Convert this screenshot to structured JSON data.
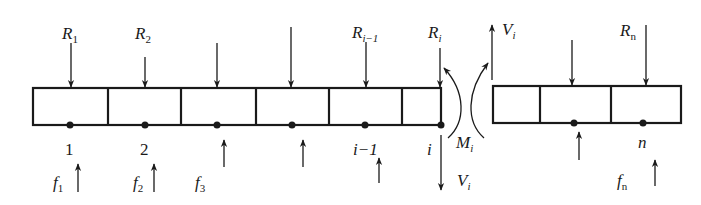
{
  "diagram": {
    "type": "beam-segment-free-body",
    "stroke_color": "#1a1a1a",
    "background": "#ffffff",
    "left_beam": {
      "x": 33,
      "y": 88,
      "width": 408,
      "height": 37,
      "dividers": [
        108,
        181,
        256,
        329,
        402
      ]
    },
    "right_beam": {
      "x": 493,
      "y": 86,
      "width": 188,
      "height": 37,
      "dividers": [
        540,
        611
      ]
    },
    "node_labels": [
      {
        "text": "1",
        "x": 70
      },
      {
        "text": "2",
        "x": 145
      },
      {
        "text": "i−1",
        "x": 365
      },
      {
        "text": "i",
        "x": 431
      },
      {
        "text": "n",
        "x": 643
      }
    ],
    "load_labels": {
      "R1": {
        "base": "R",
        "sub": "1"
      },
      "R2": {
        "base": "R",
        "sub": "2"
      },
      "Ri_1": {
        "base": "R",
        "sub": "i−1"
      },
      "Ri": {
        "base": "R",
        "sub": "i"
      },
      "Rn": {
        "base": "R",
        "sub": "n"
      }
    },
    "reaction_labels": {
      "f1": {
        "base": "f",
        "sub": "1"
      },
      "f2": {
        "base": "f",
        "sub": "2"
      },
      "f3": {
        "base": "f",
        "sub": "3"
      },
      "fn": {
        "base": "f",
        "sub": "n"
      }
    },
    "internal_forces": {
      "Vi_up": {
        "base": "V",
        "sub": "i"
      },
      "Vi_down": {
        "base": "V",
        "sub": "i"
      },
      "Mi": {
        "base": "M",
        "sub": "i"
      }
    }
  }
}
